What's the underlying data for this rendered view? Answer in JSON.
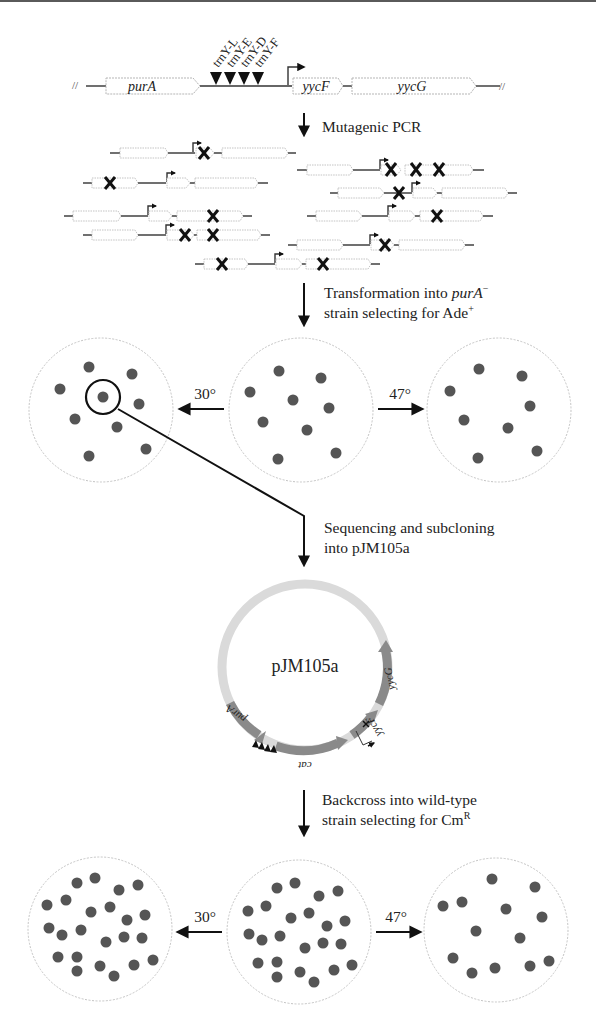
{
  "figure": {
    "top_rule_color": "#5a5a5a",
    "colony_color": "#555555",
    "locus": {
      "genes": [
        "purA",
        "yycF",
        "yycG"
      ],
      "trna_labels": [
        "trnY-L",
        "trnY-E",
        "trnY-D",
        "trnY-F"
      ]
    },
    "steps": {
      "step1": "Mutagenic PCR",
      "step2_line1": "Transformation into ",
      "step2_gene": "purA",
      "step2_sup": "−",
      "step2_line2": "strain selecting for Ade",
      "step2_line2_sup": "+",
      "step3_line1": "Sequencing and subcloning",
      "step3_line2": "into pJM105a",
      "step4_line1": "Backcross into wild-type",
      "step4_line2": "strain selecting for Cm",
      "step4_line2_sup": "R"
    },
    "temperatures": {
      "left": "30°",
      "right": "47°"
    },
    "plasmid": {
      "name": "pJM105a",
      "segments": [
        "purA",
        "cat",
        "yycF",
        "yycG"
      ]
    },
    "plates": {
      "row1": {
        "left_colonies": 9,
        "center_colonies": 9,
        "right_colonies": 8
      },
      "row2": {
        "left_colonies": 25,
        "center_colonies": 25,
        "right_colonies": 14
      }
    }
  }
}
